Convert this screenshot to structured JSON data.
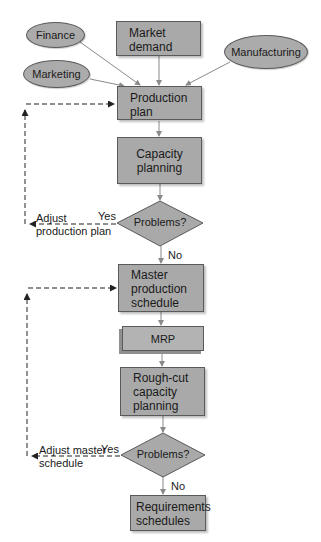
{
  "inputs": {
    "finance": "Finance",
    "marketing": "Marketing",
    "manufacturing": "Manufacturing",
    "market_demand": "Market demand"
  },
  "steps": {
    "production_plan": "Production plan",
    "capacity_planning": "Capacity planning",
    "decision_1": "Problems?",
    "master_schedule": "Master production schedule",
    "mrp": "MRP",
    "rough_cut": "Rough-cut capacity planning",
    "decision_2": "Problems?",
    "requirements": "Requirements schedules"
  },
  "branches": {
    "yes_1": "Yes",
    "no_1": "No",
    "adjust_1": "Adjust production plan",
    "yes_2": "Yes",
    "no_2": "No",
    "adjust_2": "Adjust master schedule"
  },
  "colors": {
    "box_fill": "#a9a9a9",
    "border": "#5a5a5a",
    "arrow": "#8a8a8a",
    "feedback": "#333333"
  }
}
